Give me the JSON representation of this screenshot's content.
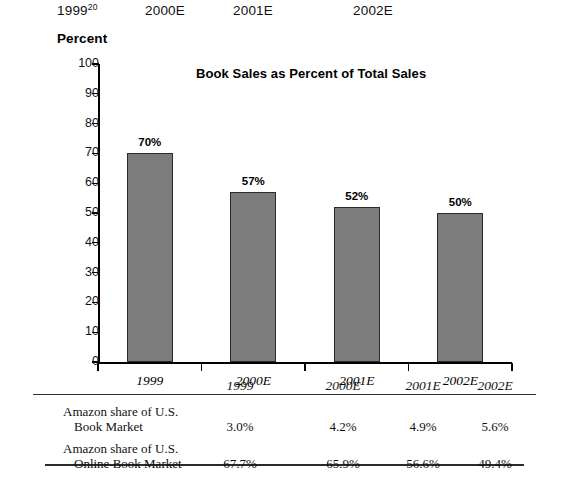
{
  "top_headers": [
    {
      "label": "1999",
      "sup": "20"
    },
    {
      "label": "2000E",
      "sup": ""
    },
    {
      "label": "2001E",
      "sup": ""
    },
    {
      "label": "2002E",
      "sup": ""
    }
  ],
  "axis_unit_label": "Percent",
  "chart_data": {
    "type": "bar",
    "title": "Book Sales as Percent of Total Sales",
    "xlabel": "",
    "ylabel": "Percent",
    "ylim": [
      0,
      100
    ],
    "ytick_labels": [
      "100",
      "90",
      "80",
      "70",
      "60",
      "50",
      "40",
      "30",
      "20",
      "10",
      "0"
    ],
    "ytick_values": [
      100,
      90,
      80,
      70,
      60,
      50,
      40,
      30,
      20,
      10,
      0
    ],
    "grid": false,
    "legend": "none",
    "bar_color": "#7c7c7c",
    "bar_edge_color": "#2a2a2a",
    "categories": [
      "1999",
      "2000E",
      "2001E",
      "2002E"
    ],
    "values": [
      70,
      57,
      52,
      50
    ],
    "data_labels": [
      "70%",
      "57%",
      "52%",
      "50%"
    ]
  },
  "table": {
    "column_headers": [
      "1999",
      "2000E",
      "2001E",
      "2002E"
    ],
    "rows": [
      {
        "label_line1": "Amazon share of U.S.",
        "label_line2": "Book Market",
        "values": [
          "3.0%",
          "4.2%",
          "4.9%",
          "5.6%"
        ]
      },
      {
        "label_line1": "Amazon share of U.S.",
        "label_line2": "Online Book Market",
        "values": [
          "67.7%",
          "65.9%",
          "56.6%",
          "49.4%"
        ]
      }
    ]
  }
}
